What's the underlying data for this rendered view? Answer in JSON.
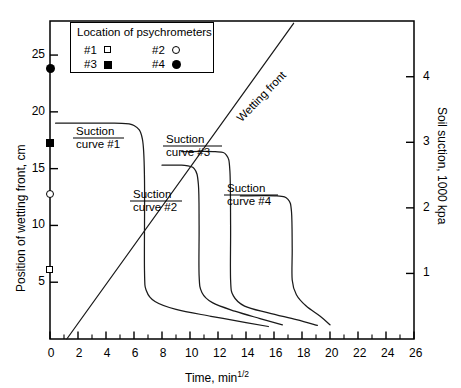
{
  "chart_data": {
    "type": "line",
    "title": "",
    "xlabel": "Time,  min 1/2",
    "xlabel_main": "Time,  min",
    "xlabel_exp": "1/2",
    "ylabel_left": "Position of wetting front, cm",
    "ylabel_right": "Soil suction, 1000 kpa",
    "xlim": [
      0,
      26
    ],
    "xticks": [
      0,
      2,
      4,
      6,
      8,
      10,
      12,
      14,
      16,
      18,
      20,
      22,
      24,
      26
    ],
    "xtick_labels": [
      "0",
      "2",
      "4",
      "6",
      "8",
      "10",
      "12",
      "14",
      "16",
      "18",
      "20",
      "22",
      "24",
      "26"
    ],
    "xminor_ticks": [
      1,
      3,
      5,
      7,
      9,
      11,
      13,
      15,
      17,
      19,
      21,
      23,
      25
    ],
    "ylim_left": [
      0,
      28
    ],
    "yticks_left": [
      5,
      10,
      15,
      20,
      25
    ],
    "ytick_labels_left": [
      "5",
      "10",
      "15",
      "20",
      "25"
    ],
    "ylim_right": [
      0,
      4.85
    ],
    "yticks_right": [
      1,
      2,
      3,
      4
    ],
    "ytick_labels_right": [
      "1",
      "2",
      "3",
      "4"
    ],
    "grid": false,
    "legend_position": "top-left-inside",
    "series": [
      {
        "name": "Wetting front",
        "kind": "straight-line",
        "points": [
          [
            1.2,
            0
          ],
          [
            17.4,
            27.8
          ]
        ]
      },
      {
        "name": "Suction curve #1",
        "kind": "suction-curve",
        "points": [
          [
            0.4,
            19.0
          ],
          [
            4.6,
            19.0
          ],
          [
            6.0,
            18.8
          ],
          [
            6.6,
            17.6
          ],
          [
            6.75,
            14.0
          ],
          [
            6.75,
            6.0
          ],
          [
            6.9,
            4.2
          ],
          [
            7.5,
            3.3
          ],
          [
            9.0,
            2.6
          ],
          [
            11.5,
            2.0
          ],
          [
            14.0,
            1.45
          ],
          [
            15.6,
            1.1
          ]
        ]
      },
      {
        "name": "Suction curve #2",
        "kind": "suction-curve",
        "points": [
          [
            8.0,
            15.3
          ],
          [
            9.4,
            15.3
          ],
          [
            10.3,
            15.0
          ],
          [
            10.6,
            13.6
          ],
          [
            10.65,
            10.0
          ],
          [
            10.65,
            5.6
          ],
          [
            10.85,
            4.1
          ],
          [
            11.6,
            3.2
          ],
          [
            13.2,
            2.45
          ],
          [
            15.0,
            1.8
          ],
          [
            16.6,
            1.25
          ]
        ]
      },
      {
        "name": "Suction curve #3",
        "kind": "suction-curve",
        "points": [
          [
            9.4,
            16.5
          ],
          [
            11.8,
            16.5
          ],
          [
            12.6,
            16.2
          ],
          [
            12.85,
            14.8
          ],
          [
            12.9,
            10.0
          ],
          [
            12.9,
            5.2
          ],
          [
            13.1,
            3.8
          ],
          [
            13.9,
            2.9
          ],
          [
            15.6,
            2.3
          ],
          [
            17.6,
            1.7
          ],
          [
            19.1,
            1.2
          ]
        ]
      },
      {
        "name": "Suction curve #4",
        "kind": "suction-curve",
        "points": [
          [
            13.6,
            12.6
          ],
          [
            16.2,
            12.6
          ],
          [
            17.0,
            12.3
          ],
          [
            17.25,
            11.2
          ],
          [
            17.3,
            8.0
          ],
          [
            17.3,
            5.2
          ],
          [
            17.6,
            3.9
          ],
          [
            18.3,
            2.9
          ],
          [
            19.3,
            2.0
          ],
          [
            20.0,
            1.25
          ]
        ]
      }
    ],
    "psychrometer_markers": [
      {
        "id": "#1",
        "marker": "open-square",
        "x": 0,
        "y": 6.1
      },
      {
        "id": "#2",
        "marker": "open-circle",
        "x": 0,
        "y": 12.8
      },
      {
        "id": "#3",
        "marker": "filled-square",
        "x": 0,
        "y": 17.3
      },
      {
        "id": "#4",
        "marker": "filled-circle",
        "x": 0,
        "y": 23.8
      }
    ],
    "annotations": [
      {
        "text_line1": "Suction",
        "text_line2": "curve #1",
        "for": "Suction curve #1"
      },
      {
        "text_line1": "Suction",
        "text_line2": "curve #2",
        "for": "Suction curve #2"
      },
      {
        "text_line1": "Suction",
        "text_line2": "curve #3",
        "for": "Suction curve #3"
      },
      {
        "text_line1": "Suction",
        "text_line2": "curve #4",
        "for": "Suction curve #4"
      },
      {
        "text_line1": "Wetting front",
        "for": "Wetting front",
        "rotated": true
      }
    ]
  },
  "legend": {
    "title": "Location of psychrometers",
    "items": [
      {
        "label": "#1",
        "marker": "open-square"
      },
      {
        "label": "#2",
        "marker": "open-circle"
      },
      {
        "label": "#3",
        "marker": "filled-square"
      },
      {
        "label": "#4",
        "marker": "filled-circle"
      }
    ]
  },
  "annotation_text": {
    "suction1_l1": "Suction",
    "suction1_l2": "curve #1",
    "suction2_l1": "Suction",
    "suction2_l2": "curve #2",
    "suction3_l1": "Suction",
    "suction3_l2": "curve #3",
    "suction4_l1": "Suction",
    "suction4_l2": "curve #4",
    "wetting_front": "Wetting front"
  },
  "axes": {
    "left_title": "Position of wetting front, cm",
    "right_title": "Soil suction, 1000 kpa",
    "x_title_main": "Time,  min",
    "x_title_exp": "1/2"
  },
  "colors": {
    "line": "#1a1a1a",
    "axis": "#000000",
    "background": "#ffffff"
  }
}
